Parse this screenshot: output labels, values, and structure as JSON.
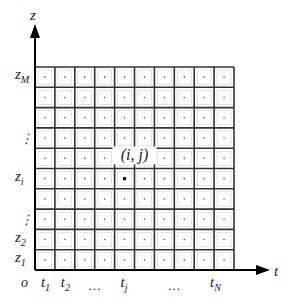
{
  "diagram": {
    "type": "discretization-grid",
    "axes": {
      "vertical": {
        "label": "z"
      },
      "horizontal": {
        "label": "t"
      },
      "origin": {
        "label": "o"
      }
    },
    "grid": {
      "columns": 10,
      "rows": 10,
      "cell_marker": "center-dot"
    },
    "z_labels": [
      {
        "main": "z",
        "sub": "M",
        "row_from_bottom": 10
      },
      {
        "main": "⋮",
        "sub": "",
        "row_from_bottom": 7
      },
      {
        "main": "z",
        "sub": "i",
        "row_from_bottom": 5
      },
      {
        "main": "⋮",
        "sub": "",
        "row_from_bottom": 3
      },
      {
        "main": "z",
        "sub": "2",
        "row_from_bottom": 2
      },
      {
        "main": "z",
        "sub": "1",
        "row_from_bottom": 1
      }
    ],
    "t_labels": [
      {
        "main": "t",
        "sub": "1",
        "col": 1
      },
      {
        "main": "t",
        "sub": "2",
        "col": 2
      },
      {
        "main": "…",
        "sub": "",
        "col": 3.5
      },
      {
        "main": "t",
        "sub": "j",
        "col": 5
      },
      {
        "main": "…",
        "sub": "",
        "col": 7.5
      },
      {
        "main": "t",
        "sub": "N",
        "col": 9.5
      }
    ],
    "highlight_point": {
      "label": "(i, j)",
      "col": 5,
      "row_from_bottom": 5
    }
  }
}
